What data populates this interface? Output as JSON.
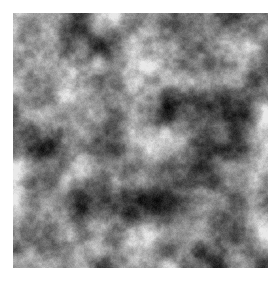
{
  "image": {
    "kind": "procedural-noise-texture",
    "title": "Grayscale Fractal Noise Texture",
    "canvas": {
      "width": 280,
      "height": 281,
      "background_color": "#ffffff"
    },
    "texture": {
      "x": 13,
      "y": 13,
      "width": 255,
      "height": 255,
      "colorspace": "grayscale",
      "pattern": "fractal-brownian-motion-clouds",
      "octaves": 5,
      "base_cell_px": 34,
      "lacunarity": 2.0,
      "persistence": 0.55,
      "seed": 20240517,
      "mean_luminance": 88,
      "min_luminance": 8,
      "max_luminance": 232,
      "contrast": 1.28,
      "gamma": 1.18,
      "grain_amplitude": 16,
      "blob_scale_px": "15-35",
      "darkest_color": "#080808",
      "brightest_color": "#e8e8e8",
      "midtone_color": "#585858"
    }
  }
}
